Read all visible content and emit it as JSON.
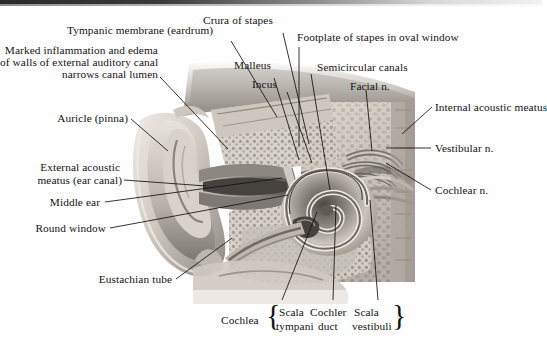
{
  "figure": {
    "type": "anatomical-illustration",
    "style": "grayscale medical illustration"
  },
  "labels": {
    "tympanic_membrane": "Tympanic membrane (eardrum)",
    "marked_inflammation_l1": "Marked inflammation and edema",
    "marked_inflammation_l2": "of walls of external auditory canal",
    "marked_inflammation_l3": "narrows canal lumen",
    "crura_of_stapes": "Crura of stapes",
    "footplate_of_stapes": "Footplate of stapes in oval window",
    "malleus": "Malleus",
    "incus": "Incus",
    "semicircular_canals": "Semicircular canals",
    "facial_n": "Facial n.",
    "internal_acoustic_meatus": "Internal acoustic meatus",
    "vestibular_n": "Vestibular n.",
    "cochlear_n": "Cochlear n.",
    "auricle": "Auricle (pinna)",
    "external_acoustic_l1": "External acoustic",
    "external_acoustic_l2": "meatus (ear canal)",
    "middle_ear": "Middle ear",
    "round_window": "Round window",
    "eustachian_tube": "Eustachian tube",
    "cochlea": "Cochlea",
    "scala_tympani_l1": "Scala",
    "scala_tympani_l2": "tympani",
    "cochlear_duct_l1": "Cochler",
    "cochlear_duct_l2": "duct",
    "scala_vestibuli_l1": "Scala",
    "scala_vestibuli_l2": "vestibuli",
    "brace_open": "{",
    "brace_close": "}"
  },
  "colors": {
    "background": "#fefefe",
    "text": "#141414",
    "leader_line": "#111111",
    "tissue_light": "#e6e2dc",
    "tissue_mid": "#b5b0a9",
    "tissue_dark": "#6e6a66",
    "bone_shadow": "#3a3836"
  }
}
